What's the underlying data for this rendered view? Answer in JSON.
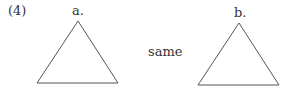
{
  "problem_number": "(4)",
  "figures": [
    {
      "label": "a.",
      "shape": "triangle",
      "points": [
        [
          78,
          21
        ],
        [
          37,
          83
        ],
        [
          118,
          83
        ]
      ]
    },
    {
      "label": "b.",
      "shape": "triangle",
      "points": [
        [
          239,
          23
        ],
        [
          198,
          85
        ],
        [
          279,
          85
        ]
      ]
    }
  ],
  "relation": "same",
  "colors": {
    "stroke": "#555555",
    "text": "#333333"
  }
}
